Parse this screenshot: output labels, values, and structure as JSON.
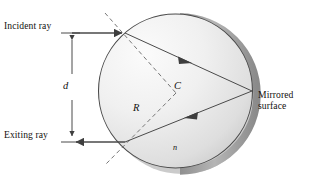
{
  "figure": {
    "labels": {
      "incident_ray": "Incident ray",
      "exiting_ray": "Exiting ray",
      "mirrored_surface_line1": "Mirrored",
      "mirrored_surface_line2": "surface",
      "distance_d": "d",
      "radius_R": "R",
      "center_C": "C",
      "index_n": "n"
    },
    "colors": {
      "ink": "#14110f",
      "sphere_fill_light": "#f2f2f2",
      "sphere_fill_dark": "#c9c9c9",
      "sphere_outline": "#3c3c3c",
      "mirror_arc": "#a8a8a8",
      "shadow": "#b9b9b9",
      "ray_line": "#4a4a4a",
      "dashed_line": "#6d6d6d",
      "background": "#ffffff"
    }
  },
  "geometry": {
    "sphere_center": [
      175.5,
      91
    ],
    "sphere_radius": 77,
    "entry_point": [
      125,
      33
    ],
    "exit_point": [
      125,
      142
    ],
    "mirror_point": [
      252,
      91
    ],
    "dimension_d_top": 33,
    "dimension_d_bottom": 142,
    "dimension_d_x": 72
  }
}
